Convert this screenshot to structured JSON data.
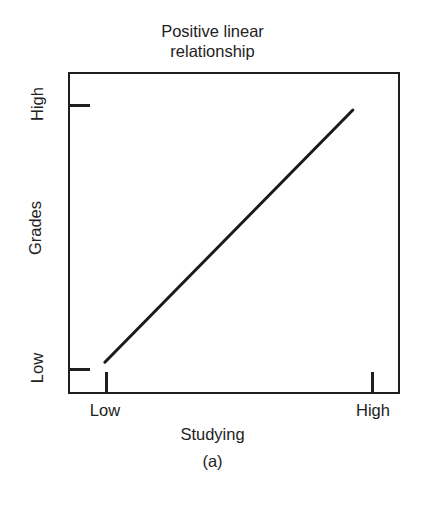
{
  "chart_data": {
    "type": "line",
    "title": "Positive linear\nrelationship",
    "title_line1": "Positive linear",
    "title_line2": "relationship",
    "caption": "(a)",
    "xlabel": "Studying",
    "ylabel": "Grades",
    "x_tick_labels": [
      "Low",
      "High"
    ],
    "y_tick_labels": [
      "Low",
      "High"
    ],
    "x_tick_low": "Low",
    "x_tick_high": "High",
    "y_tick_low": "Low",
    "y_tick_high": "High",
    "xlim": [
      0,
      1
    ],
    "ylim": [
      0,
      1
    ],
    "x_tick_values": [
      0.11,
      0.91
    ],
    "y_tick_values": [
      0.08,
      0.9
    ],
    "grid": false,
    "legend": "none",
    "series": [
      {
        "name": "Positive linear relationship",
        "x": [
          0.105,
          0.852
        ],
        "y": [
          0.105,
          0.888
        ],
        "color": "#1a1a1a",
        "style": "solid",
        "width": 3
      }
    ],
    "annotations": [],
    "frame": {
      "color": "#1f1f1f",
      "left": 68,
      "top": 72,
      "width": 332,
      "height": 322
    }
  },
  "axes": {
    "y": {
      "title": "Grades",
      "high_label": "High",
      "low_label": "Low"
    },
    "x": {
      "title": "Studying",
      "low_label": "Low",
      "high_label": "High"
    }
  }
}
